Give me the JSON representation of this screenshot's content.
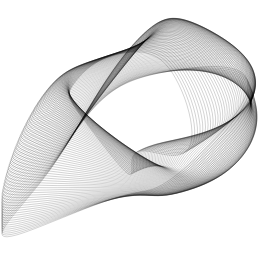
{
  "image": {
    "description": "Abstract generative line art: dense family of thin black curves forming twisted ribbon-like harmonograph shape",
    "background": "#ffffff",
    "stroke": "#000000"
  },
  "curves": {
    "count": 90,
    "stroke_opacity": 0.35,
    "stroke_width": 0.5
  }
}
